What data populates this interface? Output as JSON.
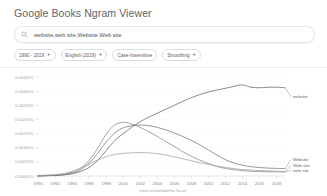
{
  "header": {
    "title": "Google Books Ngram Viewer"
  },
  "search": {
    "icon": "search-icon",
    "value": "website,web site,Website,Web site",
    "placeholder": "Enter comma-separated phrases"
  },
  "chips": [
    {
      "label": "1990 - 2019",
      "has_caret": true,
      "name": "date-range-chip"
    },
    {
      "label": "English (2019)",
      "has_caret": true,
      "name": "corpus-chip"
    },
    {
      "label": "Case-Insensitive",
      "has_caret": false,
      "name": "case-insensitive-chip"
    },
    {
      "label": "Smoothing",
      "has_caret": true,
      "name": "smoothing-chip"
    }
  ],
  "chart_data": {
    "type": "line",
    "title": "",
    "xlabel": "",
    "ylabel": "",
    "caption": "(click on line/label for focus)",
    "grid": true,
    "legend_position": "right",
    "xlim": [
      1990,
      2019
    ],
    "ylim": [
      0,
      0.0035
    ],
    "x_ticks": [
      1990,
      1992,
      1994,
      1996,
      1998,
      2000,
      2002,
      2004,
      2006,
      2008,
      2010,
      2012,
      2014,
      2016,
      2018
    ],
    "y_ticks": [
      0.0,
      0.0005,
      0.001,
      0.0015,
      0.002,
      0.0025,
      0.003,
      0.0035
    ],
    "y_tick_labels": [
      "0.00000%",
      "0.00050%",
      "0.00100%",
      "0.00150%",
      "0.00200%",
      "0.00250%",
      "0.00300%",
      "0.00350%"
    ],
    "x": [
      1990,
      1991,
      1992,
      1993,
      1994,
      1995,
      1996,
      1997,
      1998,
      1999,
      2000,
      2001,
      2002,
      2003,
      2004,
      2005,
      2006,
      2007,
      2008,
      2009,
      2010,
      2011,
      2012,
      2013,
      2014,
      2015,
      2016,
      2017,
      2018,
      2019
    ],
    "series": [
      {
        "name": "website",
        "color": "#5f6368",
        "values": [
          0.0,
          1e-05,
          2e-05,
          4e-05,
          8e-05,
          0.00016,
          0.0003,
          0.00055,
          0.0009,
          0.00125,
          0.0015,
          0.00172,
          0.00192,
          0.00208,
          0.00222,
          0.00236,
          0.0025,
          0.00264,
          0.00277,
          0.00288,
          0.00297,
          0.00304,
          0.0031,
          0.00317,
          0.00322,
          0.00314,
          0.00312,
          0.00314,
          0.00314,
          0.00312
        ]
      },
      {
        "name": "Website",
        "color": "#70757a",
        "values": [
          0.0,
          1e-05,
          2e-05,
          4e-05,
          0.0001,
          0.00022,
          0.00045,
          0.0008,
          0.0012,
          0.00152,
          0.0017,
          0.00178,
          0.0018,
          0.00178,
          0.00172,
          0.00163,
          0.00152,
          0.0014,
          0.00126,
          0.0011,
          0.00092,
          0.00074,
          0.00058,
          0.00046,
          0.00038,
          0.00033,
          0.0003,
          0.00028,
          0.00027,
          0.00026
        ]
      },
      {
        "name": "Web site",
        "color": "#80868b",
        "values": [
          1e-05,
          2e-05,
          3e-05,
          6e-05,
          0.00013,
          0.00028,
          0.00055,
          0.00098,
          0.00148,
          0.0018,
          0.0019,
          0.00184,
          0.00172,
          0.00157,
          0.0014,
          0.00122,
          0.00104,
          0.00086,
          0.0007,
          0.00056,
          0.00044,
          0.00034,
          0.00027,
          0.00022,
          0.00019,
          0.00017,
          0.00016,
          0.00015,
          0.00015,
          0.00014
        ]
      },
      {
        "name": "web site",
        "color": "#9aa0a6",
        "values": [
          2e-05,
          3e-05,
          5e-05,
          9e-05,
          0.00016,
          0.00028,
          0.00042,
          0.00056,
          0.00068,
          0.00076,
          0.0008,
          0.00082,
          0.00083,
          0.00082,
          0.00079,
          0.00074,
          0.00068,
          0.00061,
          0.00054,
          0.00047,
          0.00041,
          0.00035,
          0.0003,
          0.00026,
          0.00023,
          0.00021,
          0.00019,
          0.00018,
          0.00017,
          0.00016
        ]
      }
    ],
    "legend_top": [
      "website"
    ],
    "legend_bottom": [
      "Website",
      "Web site",
      "web site"
    ]
  }
}
